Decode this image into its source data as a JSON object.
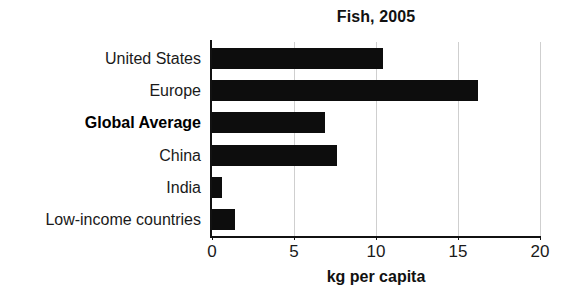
{
  "chart_data": {
    "type": "bar",
    "orientation": "horizontal",
    "title": "Fish, 2005",
    "xlabel": "kg per capita",
    "ylabel": "",
    "categories": [
      "United States",
      "Europe",
      "Global Average",
      "China",
      "India",
      "Low-income countries"
    ],
    "values": [
      10.4,
      16.2,
      6.9,
      7.6,
      0.6,
      1.4
    ],
    "xlim": [
      0,
      20
    ],
    "xticks": [
      0,
      5,
      10,
      15,
      20
    ],
    "xtick_labels": [
      "0",
      "5",
      "10",
      "15",
      "20"
    ],
    "grid": "vertical-only",
    "legend": "none",
    "bar_color": "#0d0d0d",
    "gridline_color": "#cfcfcf",
    "axis_color": "#111111",
    "emphasized_category": "Global Average"
  }
}
